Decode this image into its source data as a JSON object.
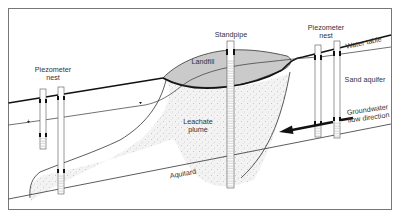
{
  "diagram": {
    "labels": {
      "piezometer_nest_left_line1": "Piezometer",
      "piezometer_nest_left_line2": "nest",
      "standpipe": "Standpipe",
      "piezometer_nest_right_line1": "Piezometer",
      "piezometer_nest_right_line2": "nest",
      "landfill": "Landfill",
      "water_table": "Water table",
      "sand_aquifer": "Sand aquifer",
      "groundwater_line1": "Groundwater",
      "groundwater_line2": "flow direction",
      "leachate_line1": "Leachate",
      "leachate_line2": "plume",
      "aquitard": "Aquitard"
    },
    "colors": {
      "frame": "#666666",
      "landfill_fill": "#c8c8c8",
      "plume_fill": "#efefef",
      "line": "#222222"
    }
  }
}
